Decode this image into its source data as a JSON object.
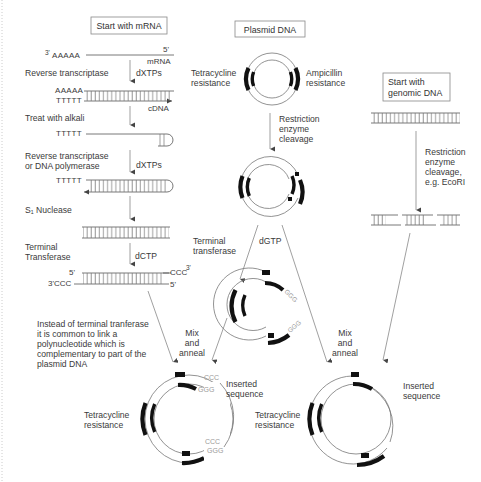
{
  "boxes": {
    "mrna": "Start with mRNA",
    "plasmid": "Plasmid DNA",
    "genomic_line1": "Start with",
    "genomic_line2": "genomic DNA"
  },
  "mrna_pathway": {
    "start_3prime": "3'",
    "polyA": "AAAAA",
    "end_5prime": "5'",
    "mrna_label": "mRNA",
    "step1": {
      "label": "Reverse transcriptase",
      "reagent": "dXTPs"
    },
    "hybrid_top": "AAAAA",
    "hybrid_bottom": "TTTTT",
    "cdna_label": "cDNA",
    "step2": {
      "label": "Treat with alkali"
    },
    "after_alkali": "TTTTT",
    "step3": {
      "label_line1": "Reverse transcriptase",
      "label_line2": "or DNA polymerase",
      "reagent": "dXTPs"
    },
    "hairpin_label": "TTTTT",
    "step4": {
      "label": "S₁ Nuclease"
    },
    "step5": {
      "label_line1": "Terminal",
      "label_line2": "Transferase",
      "reagent": "dCTP"
    },
    "tailed_left_top": "5'",
    "tailed_left_bottom": "3'CCC",
    "tailed_right_top": "CCC",
    "tailed_right_top_sup": "3'",
    "tailed_right_bottom": "5'"
  },
  "plasmid_pathway": {
    "tet_line1": "Tetracycline",
    "tet_line2": "resistance",
    "amp_line1": "Ampicillin",
    "amp_line2": "resistance",
    "cleavage_line1": "Restriction",
    "cleavage_line2": "enzyme",
    "cleavage_line3": "cleavage",
    "tt_line1": "Terminal",
    "tt_line2": "transferase",
    "reagent": "dGTP",
    "ggg_tail": "GGG"
  },
  "genomic_pathway": {
    "cleavage_line1": "Restriction",
    "cleavage_line2": "enzyme",
    "cleavage_line3": "cleavage,",
    "cleavage_line4": "e.g. EcoRI"
  },
  "note": {
    "line1": "Instead of terminal tranferase",
    "line2": "it is common to link a",
    "line3": "polynucleotide which is",
    "line4": "complementary to part of the",
    "line5": "plasmid DNA"
  },
  "mix_left": {
    "line1": "Mix",
    "line2": "and",
    "line3": "anneal"
  },
  "mix_right": {
    "line1": "Mix",
    "line2": "and",
    "line3": "anneal"
  },
  "result_left": {
    "tet_line1": "Tetracycline",
    "tet_line2": "resistance",
    "insert_line1": "Inserted",
    "insert_line2": "sequence",
    "ccc": "CCC",
    "ggg": "GGG"
  },
  "result_right": {
    "tet_line1": "Tetracycline",
    "tet_line2": "resistance",
    "insert_line1": "Inserted",
    "insert_line2": "sequence"
  },
  "colors": {
    "gene_marker": "#111111",
    "strand": "#555555",
    "label": "#3a3a3a",
    "tail_letters": "#9a9a9a"
  }
}
